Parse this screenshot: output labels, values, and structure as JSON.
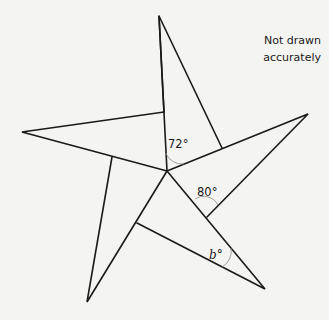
{
  "note": {
    "line1": "Not drawn",
    "line2": "accurately"
  },
  "angles": {
    "a1": "72°",
    "a2": "80°",
    "b": "b°"
  },
  "colors": {
    "line": "#1a1a1a",
    "background": "#f4f4f2"
  }
}
